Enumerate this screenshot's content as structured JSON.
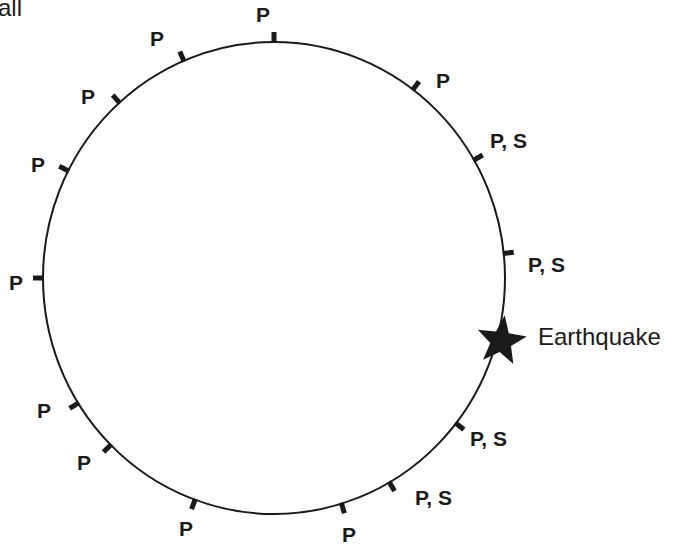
{
  "caption": "all",
  "diagram": {
    "earth": {
      "cx": 274,
      "cy": 278,
      "rx": 231,
      "ry": 236,
      "stroke": "#1a1a1a"
    },
    "earthquake": {
      "label": "Earthquake",
      "angle_deg": 105,
      "icon": "star-icon",
      "color": "#1a1a1a"
    },
    "stations": [
      {
        "angle": 0,
        "label": "P",
        "lx": 263,
        "ly": 22,
        "anchor": "middle"
      },
      {
        "angle": 37,
        "label": "P",
        "lx": 436,
        "ly": 88,
        "anchor": "start"
      },
      {
        "angle": 60,
        "label": "P, S",
        "lx": 490,
        "ly": 148,
        "anchor": "start"
      },
      {
        "angle": 84,
        "label": "P, S",
        "lx": 528,
        "ly": 272,
        "anchor": "start"
      },
      {
        "angle": 128,
        "label": "P, S",
        "lx": 470,
        "ly": 446,
        "anchor": "start"
      },
      {
        "angle": 150,
        "label": "P, S",
        "lx": 415,
        "ly": 505,
        "anchor": "start"
      },
      {
        "angle": 163,
        "label": "P",
        "lx": 349,
        "ly": 542,
        "anchor": "middle"
      },
      {
        "angle": 200,
        "label": "P",
        "lx": 186,
        "ly": 536,
        "anchor": "middle"
      },
      {
        "angle": 225,
        "label": "P",
        "lx": 84,
        "ly": 470,
        "anchor": "middle"
      },
      {
        "angle": 238,
        "label": "P",
        "lx": 44,
        "ly": 418,
        "anchor": "middle"
      },
      {
        "angle": 270,
        "label": "P",
        "lx": 16,
        "ly": 290,
        "anchor": "middle"
      },
      {
        "angle": 297,
        "label": "P",
        "lx": 38,
        "ly": 172,
        "anchor": "middle"
      },
      {
        "angle": 318,
        "label": "P",
        "lx": 88,
        "ly": 104,
        "anchor": "middle"
      },
      {
        "angle": 337,
        "label": "P",
        "lx": 157,
        "ly": 46,
        "anchor": "middle"
      }
    ]
  }
}
